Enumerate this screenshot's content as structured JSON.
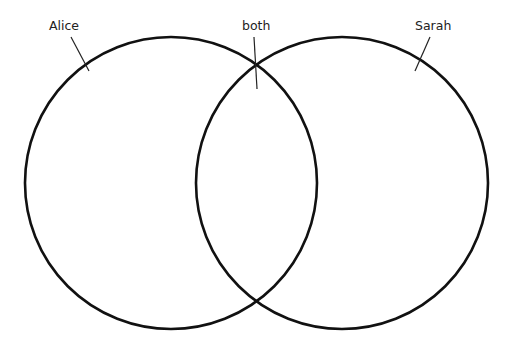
{
  "diagram": {
    "type": "venn",
    "stroke_color": "#111111",
    "sets": [
      {
        "id": "alice",
        "label": "Alice",
        "cx": 171,
        "cy": 183,
        "r": 146
      },
      {
        "id": "sarah",
        "label": "Sarah",
        "cx": 342,
        "cy": 183,
        "r": 146
      }
    ],
    "intersection": {
      "label": "both"
    },
    "labels": {
      "alice": "Alice",
      "both": "both",
      "sarah": "Sarah"
    }
  }
}
